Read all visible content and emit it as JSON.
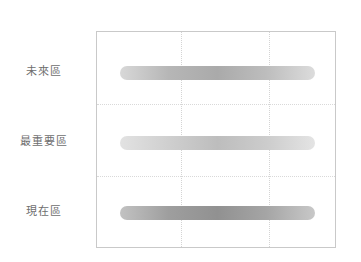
{
  "page": {
    "width": 361,
    "height": 262,
    "background": "#ffffff",
    "top_caption": "             "
  },
  "plot": {
    "border_color": "#c9c9c9",
    "gridline_color": "#d9d9d9",
    "vertical_gridline_color": "#d4d4d4"
  },
  "chart_data": {
    "type": "bar",
    "orientation": "horizontal",
    "title": "",
    "subtitle": "",
    "xlabel": "",
    "ylabel": "",
    "grid": true,
    "legend": false,
    "legend_position": "none",
    "categories": [
      "未來區",
      "最重要區",
      "現在區"
    ],
    "category_labels_en": [
      "Future Zone",
      "Most Important Zone",
      "Present Zone"
    ],
    "values": [
      100,
      100,
      100
    ],
    "xlim": [
      0,
      100
    ],
    "xticks": [],
    "xtick_labels": [],
    "yticks": [],
    "ytick_labels": [],
    "vertical_gridlines": [
      35,
      72
    ],
    "horizontal_gridlines": [
      33.3,
      66.7
    ],
    "series": [
      {
        "name": "未來區",
        "value": 100,
        "bar_height_px": 14,
        "gradient_stops": [
          "#d8d8d8",
          "#b6b6b6",
          "#aaaaaa",
          "#bdbdbd",
          "#dcdcdc"
        ],
        "shade": "medium"
      },
      {
        "name": "最重要區",
        "value": 100,
        "bar_height_px": 14,
        "gradient_stops": [
          "#e2e2e2",
          "#cfcfcf",
          "#bdbdbd",
          "#cccccc",
          "#e4e4e4"
        ],
        "shade": "light"
      },
      {
        "name": "現在區",
        "value": 100,
        "bar_height_px": 14,
        "gradient_stops": [
          "#c2c2c2",
          "#9e9e9e",
          "#919191",
          "#a5a5a5",
          "#c8c8c8"
        ],
        "shade": "dark"
      }
    ]
  }
}
